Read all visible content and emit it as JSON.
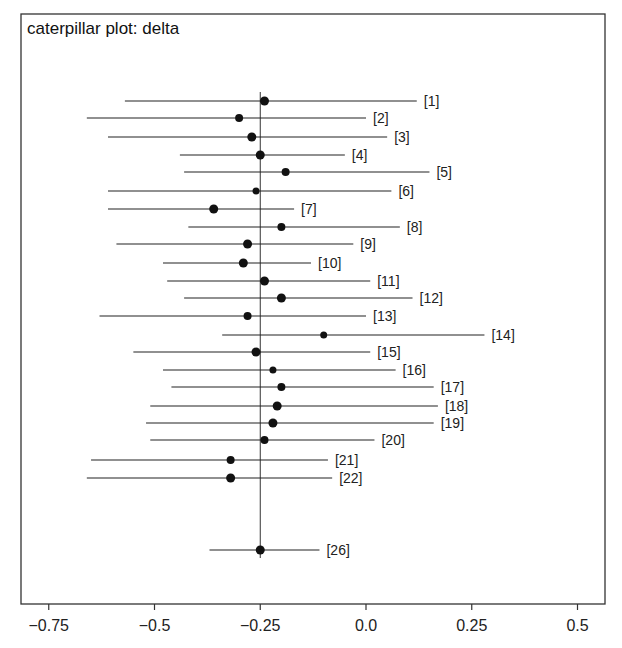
{
  "chart_data": {
    "type": "caterpillar",
    "title": "caterpillar plot: delta",
    "xlabel": "",
    "ylabel": "",
    "xlim": [
      -0.8,
      0.56
    ],
    "xticks": [
      -0.75,
      -0.5,
      -0.25,
      0.0,
      0.25,
      0.5
    ],
    "xtick_labels": [
      "−0.75",
      "−0.5",
      "−0.25",
      "0.0",
      "0.25",
      "0.5"
    ],
    "reference_line": -0.25,
    "grid": false,
    "legend": null,
    "series": [
      {
        "label": "[1]",
        "mean": -0.24,
        "lower": -0.57,
        "upper": 0.12
      },
      {
        "label": "[2]",
        "mean": -0.3,
        "lower": -0.66,
        "upper": 0.0
      },
      {
        "label": "[3]",
        "mean": -0.27,
        "lower": -0.61,
        "upper": 0.05
      },
      {
        "label": "[4]",
        "mean": -0.25,
        "lower": -0.44,
        "upper": -0.05
      },
      {
        "label": "[5]",
        "mean": -0.19,
        "lower": -0.43,
        "upper": 0.15
      },
      {
        "label": "[6]",
        "mean": -0.26,
        "lower": -0.61,
        "upper": 0.06
      },
      {
        "label": "[7]",
        "mean": -0.36,
        "lower": -0.61,
        "upper": -0.17
      },
      {
        "label": "[8]",
        "mean": -0.2,
        "lower": -0.42,
        "upper": 0.08
      },
      {
        "label": "[9]",
        "mean": -0.28,
        "lower": -0.59,
        "upper": -0.03
      },
      {
        "label": "[10]",
        "mean": -0.29,
        "lower": -0.48,
        "upper": -0.13
      },
      {
        "label": "[11]",
        "mean": -0.24,
        "lower": -0.47,
        "upper": 0.01
      },
      {
        "label": "[12]",
        "mean": -0.2,
        "lower": -0.43,
        "upper": 0.11
      },
      {
        "label": "[13]",
        "mean": -0.28,
        "lower": -0.63,
        "upper": 0.0
      },
      {
        "label": "[14]",
        "mean": -0.1,
        "lower": -0.34,
        "upper": 0.28
      },
      {
        "label": "[15]",
        "mean": -0.26,
        "lower": -0.55,
        "upper": 0.01
      },
      {
        "label": "[16]",
        "mean": -0.22,
        "lower": -0.48,
        "upper": 0.07
      },
      {
        "label": "[17]",
        "mean": -0.2,
        "lower": -0.46,
        "upper": 0.16
      },
      {
        "label": "[18]",
        "mean": -0.21,
        "lower": -0.51,
        "upper": 0.17
      },
      {
        "label": "[19]",
        "mean": -0.22,
        "lower": -0.52,
        "upper": 0.16
      },
      {
        "label": "[20]",
        "mean": -0.24,
        "lower": -0.51,
        "upper": 0.02
      },
      {
        "label": "[21]",
        "mean": -0.32,
        "lower": -0.65,
        "upper": -0.09
      },
      {
        "label": "[22]",
        "mean": -0.32,
        "lower": -0.66,
        "upper": -0.08
      },
      {
        "label": "[26]",
        "mean": -0.25,
        "lower": -0.37,
        "upper": -0.11
      }
    ],
    "row_y_px": [
      101,
      118,
      137,
      155,
      172,
      191,
      209,
      227,
      244,
      263,
      281,
      298,
      316,
      335,
      352,
      370,
      387,
      406,
      423,
      440,
      460,
      478,
      550
    ],
    "dot_radius_px": [
      4.5,
      4,
      4.5,
      4.5,
      4,
      3.5,
      4.5,
      4,
      4.5,
      4.5,
      4.5,
      4.5,
      4,
      3.5,
      4.5,
      3.5,
      4,
      4.5,
      4.5,
      4,
      4,
      4.5,
      4.5
    ]
  },
  "layout": {
    "frame": {
      "left": 21,
      "top": 14,
      "right": 605,
      "bottom": 604
    },
    "x_zero_px": 366,
    "px_per_unit": 423,
    "refline_top": 92,
    "refline_bottom": 558
  }
}
